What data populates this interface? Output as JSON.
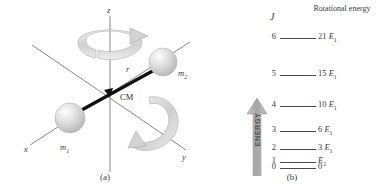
{
  "figure": {
    "panel_a": {
      "caption": "(a)",
      "axes": [
        {
          "name": "z",
          "label": "z"
        },
        {
          "name": "x",
          "label": "x"
        },
        {
          "name": "y",
          "label": "y"
        }
      ],
      "masses": [
        {
          "name": "mass-1",
          "label": "m",
          "sub": "1"
        },
        {
          "name": "mass-2",
          "label": "m",
          "sub": "2"
        }
      ],
      "bond_label": "r",
      "center_of_mass_label": "CM",
      "rotation_arrows": [
        "rotation-arrow-z",
        "rotation-arrow-y"
      ],
      "colors": {
        "sphere": "#d8d8d8",
        "axis": "#6e6e6e",
        "bond": "#111111",
        "arrow": "#c9c9c9"
      }
    },
    "panel_b": {
      "caption": "(b)",
      "column_headers": {
        "quantum_number": "J",
        "energy": "Rotational energy"
      },
      "energy_axis_label": "ENERGY",
      "colors": {
        "arrow": "#a8a8a8",
        "level": "#4a4a4a"
      }
    }
  },
  "chart_data": {
    "type": "line",
    "xlabel": "",
    "ylabel": "Rotational energy",
    "ylim": [
      0,
      21
    ],
    "grid": false,
    "legend": "none",
    "categories": [
      "0",
      "1",
      "2",
      "3",
      "4",
      "5",
      "6"
    ],
    "values": [
      0,
      1,
      3,
      6,
      10,
      15,
      21
    ],
    "levels": [
      {
        "J": "6",
        "energy": 21,
        "label_prefix": "21",
        "label_symbol": "E",
        "label_sub": "1",
        "label": "21 E1"
      },
      {
        "J": "5",
        "energy": 15,
        "label_prefix": "15",
        "label_symbol": "E",
        "label_sub": "1",
        "label": "15 E1"
      },
      {
        "J": "4",
        "energy": 10,
        "label_prefix": "10",
        "label_symbol": "E",
        "label_sub": "1",
        "label": "10 E1"
      },
      {
        "J": "3",
        "energy": 6,
        "label_prefix": "6",
        "label_symbol": "E",
        "label_sub": "1",
        "label": "6 E1"
      },
      {
        "J": "2",
        "energy": 3,
        "label_prefix": "3",
        "label_symbol": "E",
        "label_sub": "1",
        "label": "3 E1"
      },
      {
        "J": "1",
        "energy": 1,
        "label_prefix": "",
        "label_symbol": "E",
        "label_sub": "1",
        "label": "E1"
      },
      {
        "J": "0",
        "energy": 0,
        "label_prefix": "0",
        "label_symbol": "",
        "label_sub": "",
        "label": "0"
      }
    ]
  }
}
